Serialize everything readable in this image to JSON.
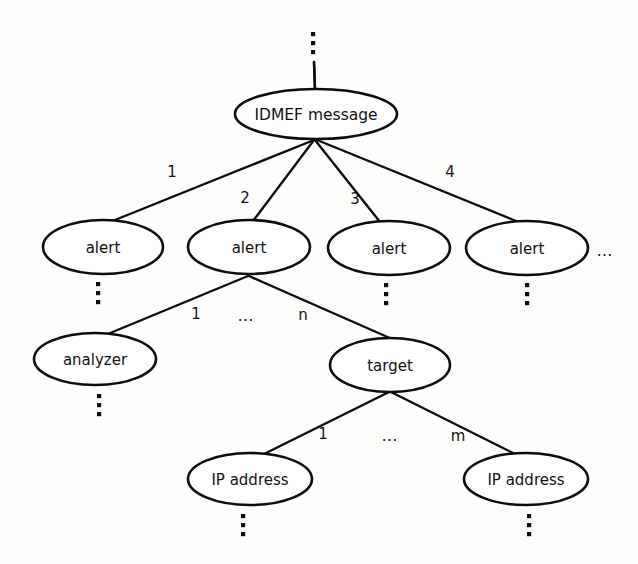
{
  "diagram": {
    "background_color": "#fdfdfc",
    "stroke_color": "#0d0d0d",
    "text_color": "#111111",
    "nodes": [
      {
        "id": "idmef",
        "label": "IDMEF message",
        "cx": 316,
        "cy": 114,
        "rx": 81,
        "ry": 25
      },
      {
        "id": "alert1",
        "label": "alert",
        "cx": 103,
        "cy": 247,
        "rx": 60,
        "ry": 27
      },
      {
        "id": "alert2",
        "label": "alert",
        "cx": 249,
        "cy": 247,
        "rx": 61,
        "ry": 27
      },
      {
        "id": "alert3",
        "label": "alert",
        "cx": 389,
        "cy": 248,
        "rx": 61,
        "ry": 27
      },
      {
        "id": "alert4",
        "label": "alert",
        "cx": 527,
        "cy": 248,
        "rx": 61,
        "ry": 27
      },
      {
        "id": "analyzer",
        "label": "analyzer",
        "cx": 95,
        "cy": 359,
        "rx": 61,
        "ry": 26
      },
      {
        "id": "target",
        "label": "target",
        "cx": 390,
        "cy": 365,
        "rx": 60,
        "ry": 27
      },
      {
        "id": "ip1",
        "label": "IP address",
        "cx": 250,
        "cy": 479,
        "rx": 62,
        "ry": 26
      },
      {
        "id": "ip2",
        "label": "IP address",
        "cx": 526,
        "cy": 479,
        "rx": 62,
        "ry": 26
      }
    ],
    "edges": [
      {
        "id": "root-to-idmef",
        "from": "root-stub",
        "to": "idmef",
        "x1": 314,
        "y1": 62,
        "x2": 315,
        "y2": 90,
        "label": ""
      },
      {
        "id": "idmef-alert1",
        "from": "idmef",
        "to": "alert1",
        "x1": 314,
        "y1": 140,
        "x2": 110,
        "y2": 222,
        "label": "1"
      },
      {
        "id": "idmef-alert2",
        "from": "idmef",
        "to": "alert2",
        "x1": 314,
        "y1": 140,
        "x2": 253,
        "y2": 221,
        "label": "2"
      },
      {
        "id": "idmef-alert3",
        "from": "idmef",
        "to": "alert3",
        "x1": 315,
        "y1": 140,
        "x2": 380,
        "y2": 222,
        "label": "3"
      },
      {
        "id": "idmef-alert4",
        "from": "idmef",
        "to": "alert4",
        "x1": 317,
        "y1": 140,
        "x2": 521,
        "y2": 223,
        "label": "4"
      },
      {
        "id": "alert2-analyzer",
        "from": "alert2",
        "to": "analyzer",
        "x1": 248,
        "y1": 276,
        "x2": 103,
        "y2": 336,
        "label": "1"
      },
      {
        "id": "alert2-target",
        "from": "alert2",
        "to": "target",
        "x1": 249,
        "y1": 276,
        "x2": 392,
        "y2": 339,
        "label": "n"
      },
      {
        "id": "target-ip1",
        "from": "target",
        "to": "ip1",
        "x1": 389,
        "y1": 392,
        "x2": 258,
        "y2": 457,
        "label": "1"
      },
      {
        "id": "target-ip2",
        "from": "target",
        "to": "ip2",
        "x1": 391,
        "y1": 392,
        "x2": 519,
        "y2": 456,
        "label": "m"
      }
    ],
    "edge_labels": [
      {
        "id": "lbl-1-top",
        "text": "1",
        "x": 172,
        "y": 172
      },
      {
        "id": "lbl-2-top",
        "text": "2",
        "x": 245,
        "y": 198
      },
      {
        "id": "lbl-3-top",
        "text": "3",
        "x": 355,
        "y": 199
      },
      {
        "id": "lbl-4-top",
        "text": "4",
        "x": 450,
        "y": 172
      },
      {
        "id": "lbl-1-mid",
        "text": "1",
        "x": 196,
        "y": 314
      },
      {
        "id": "lbl-n-mid",
        "text": "n",
        "x": 303,
        "y": 315
      },
      {
        "id": "lbl-1-bottom",
        "text": "1",
        "x": 323,
        "y": 434
      },
      {
        "id": "lbl-m-bottom",
        "text": "m",
        "x": 458,
        "y": 436
      }
    ],
    "inline_ellipses": [
      {
        "id": "ellipsis-alert-row",
        "text": "…",
        "x": 605,
        "y": 251
      },
      {
        "id": "ellipsis-mid-row",
        "text": "…",
        "x": 246,
        "y": 316
      },
      {
        "id": "ellipsis-bottom-row",
        "text": "…",
        "x": 390,
        "y": 436
      }
    ],
    "vertical_dots": [
      {
        "id": "dots-above-idmef",
        "x": 313,
        "y_top": 32,
        "count": 3
      },
      {
        "id": "dots-below-alert1",
        "x": 98,
        "y_top": 282,
        "count": 3
      },
      {
        "id": "dots-below-alert3",
        "x": 386,
        "y_top": 283,
        "count": 3
      },
      {
        "id": "dots-below-alert4",
        "x": 527,
        "y_top": 283,
        "count": 3
      },
      {
        "id": "dots-below-analyzer",
        "x": 99,
        "y_top": 394,
        "count": 3
      },
      {
        "id": "dots-below-ip1",
        "x": 243,
        "y_top": 514,
        "count": 3
      },
      {
        "id": "dots-below-ip2",
        "x": 529,
        "y_top": 514,
        "count": 3
      }
    ]
  }
}
